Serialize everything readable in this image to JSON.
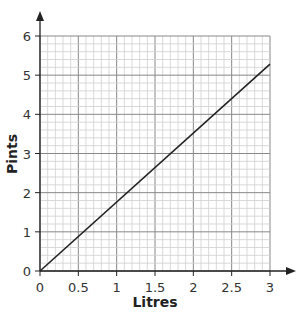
{
  "chart_data": {
    "type": "line",
    "title": "",
    "xlabel": "Litres",
    "ylabel": "Pints",
    "xlim": [
      0,
      3
    ],
    "ylim": [
      0,
      6
    ],
    "x_ticks": [
      "0",
      "0.5",
      "1",
      "1.5",
      "2",
      "2.5",
      "3"
    ],
    "y_ticks": [
      "0",
      "1",
      "2",
      "3",
      "4",
      "5",
      "6"
    ],
    "grid": true,
    "series": [
      {
        "name": "Litres to pints",
        "x": [
          0,
          3
        ],
        "y": [
          0,
          5.28
        ]
      }
    ]
  }
}
